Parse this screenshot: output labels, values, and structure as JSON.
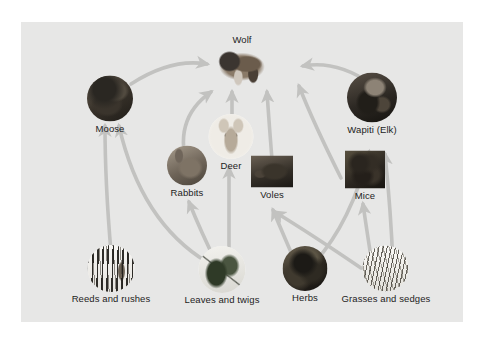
{
  "figure": {
    "panel_background": "#e7e7e6",
    "page_background": "#ffffff",
    "arrow_color": "#c2c2c0",
    "label_color": "#1d1d1d"
  },
  "nodes": [
    {
      "id": "wolf",
      "label": "Wolf",
      "art": "art-wolf",
      "x": 242,
      "y": 62,
      "w": 62,
      "h": 44,
      "crop": "none",
      "label_pos": "above",
      "trophic": "carnivore"
    },
    {
      "id": "moose",
      "label": "Moose",
      "art": "art-moose",
      "x": 110,
      "y": 105,
      "w": 46,
      "h": 46,
      "crop": "circle",
      "label_pos": "below",
      "trophic": "herbivore"
    },
    {
      "id": "elk",
      "label": "Wapiti (Elk)",
      "art": "art-elk",
      "x": 372,
      "y": 104,
      "w": 50,
      "h": 50,
      "crop": "circle",
      "label_pos": "below",
      "trophic": "herbivore"
    },
    {
      "id": "deer",
      "label": "Deer",
      "art": "art-deer",
      "x": 231,
      "y": 143,
      "w": 45,
      "h": 45,
      "crop": "circle",
      "label_pos": "below",
      "trophic": "herbivore"
    },
    {
      "id": "rabbits",
      "label": "Rabbits",
      "art": "art-rabbit",
      "x": 187,
      "y": 172,
      "w": 40,
      "h": 40,
      "crop": "circle",
      "label_pos": "below",
      "trophic": "herbivore"
    },
    {
      "id": "voles",
      "label": "Voles",
      "art": "art-vole",
      "x": 272,
      "y": 178,
      "w": 42,
      "h": 32,
      "crop": "none",
      "label_pos": "below",
      "trophic": "herbivore"
    },
    {
      "id": "mice",
      "label": "Mice",
      "art": "art-mice",
      "x": 365,
      "y": 176,
      "w": 40,
      "h": 38,
      "crop": "none",
      "label_pos": "below",
      "trophic": "herbivore"
    },
    {
      "id": "reeds",
      "label": "Reeds and rushes",
      "art": "art-reeds",
      "x": 111,
      "y": 275,
      "w": 47,
      "h": 47,
      "crop": "circle",
      "label_pos": "below",
      "trophic": "producer"
    },
    {
      "id": "leaves",
      "label": "Leaves and twigs",
      "art": "art-leaves",
      "x": 222,
      "y": 276,
      "w": 47,
      "h": 47,
      "crop": "circle",
      "label_pos": "below",
      "trophic": "producer"
    },
    {
      "id": "herbs",
      "label": "Herbs",
      "art": "art-herbs",
      "x": 305,
      "y": 275,
      "w": 45,
      "h": 45,
      "crop": "circle",
      "label_pos": "below",
      "trophic": "producer"
    },
    {
      "id": "grasses",
      "label": "Grasses and sedges",
      "art": "art-grasses",
      "x": 386,
      "y": 275,
      "w": 46,
      "h": 46,
      "crop": "circle",
      "label_pos": "below",
      "trophic": "producer"
    }
  ],
  "links": [
    {
      "from": "moose",
      "to": "wolf"
    },
    {
      "from": "elk",
      "to": "wolf"
    },
    {
      "from": "rabbits",
      "to": "wolf"
    },
    {
      "from": "deer",
      "to": "wolf"
    },
    {
      "from": "voles",
      "to": "wolf"
    },
    {
      "from": "mice",
      "to": "wolf"
    },
    {
      "from": "reeds",
      "to": "moose"
    },
    {
      "from": "leaves",
      "to": "moose"
    },
    {
      "from": "leaves",
      "to": "rabbits"
    },
    {
      "from": "leaves",
      "to": "deer"
    },
    {
      "from": "herbs",
      "to": "voles"
    },
    {
      "from": "herbs",
      "to": "elk"
    },
    {
      "from": "grasses",
      "to": "voles"
    },
    {
      "from": "grasses",
      "to": "mice"
    },
    {
      "from": "grasses",
      "to": "elk"
    }
  ]
}
